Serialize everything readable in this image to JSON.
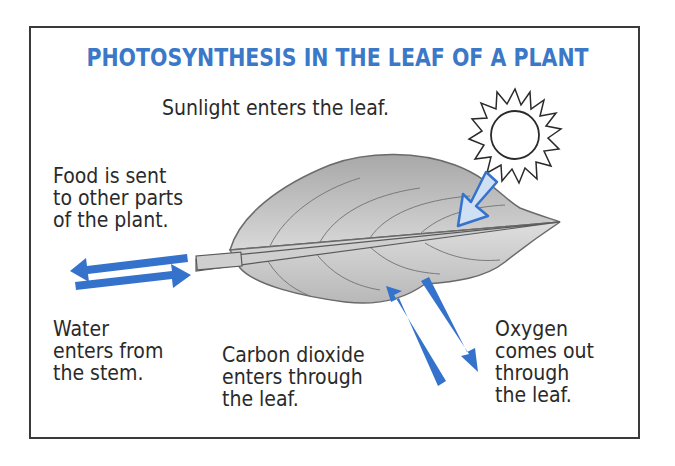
{
  "diagram": {
    "title": "PHOTOSYNTHESIS IN THE LEAF OF A PLANT",
    "labels": {
      "sunlight": "Sunlight enters the leaf.",
      "food": "Food is sent\nto other parts\nof the plant.",
      "water": "Water\nenters from\nthe stem.",
      "carbon_dioxide": "Carbon dioxide\nenters through\nthe leaf.",
      "oxygen": "Oxygen\ncomes out\nthrough\nthe leaf."
    },
    "colors": {
      "title": "#3b78c8",
      "arrow": "#3572cc",
      "sun_arrow_fill": "#cfe0f5",
      "leaf_fill": "#c8c8c8",
      "border": "#3a3a3a",
      "text": "#2a2a2a"
    }
  }
}
